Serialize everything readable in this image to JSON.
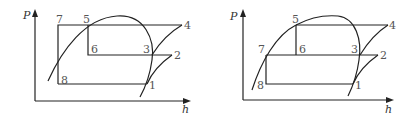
{
  "colors": {
    "line": "#222222",
    "label": "#555555"
  },
  "diagrams": [
    {
      "id": "left",
      "axes": {
        "y_label": "P",
        "x_label": "h"
      },
      "points": {
        "p1": "1",
        "p2": "2",
        "p3": "3",
        "p4": "4",
        "p5": "5",
        "p6": "6",
        "p7": "7",
        "p8": "8"
      }
    },
    {
      "id": "right",
      "axes": {
        "y_label": "P",
        "x_label": "h"
      },
      "points": {
        "p1": "1",
        "p2": "2",
        "p3": "3",
        "p4": "4",
        "p5": "5",
        "p6": "6",
        "p7": "7",
        "p8": "8"
      }
    }
  ]
}
